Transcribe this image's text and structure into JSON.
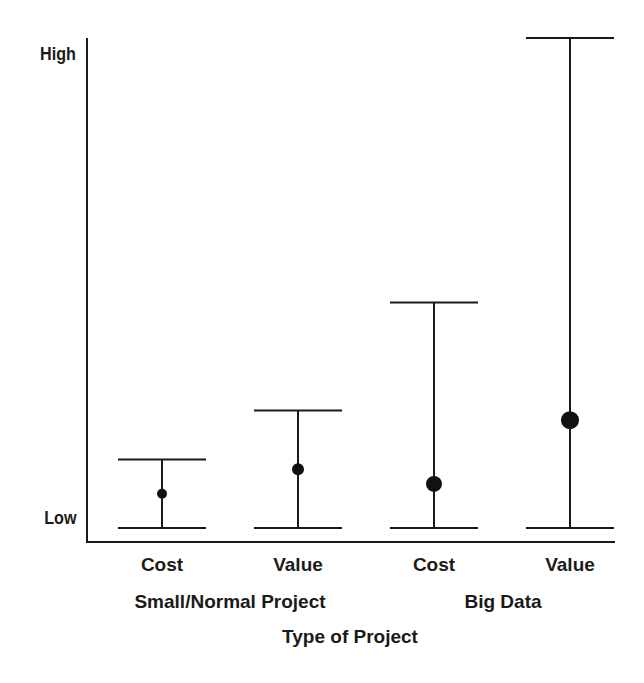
{
  "chart_data": {
    "type": "errorbar",
    "title": "",
    "xlabel": "Type of Project",
    "ylabel": "",
    "y_tick_labels": [
      "Low",
      "High"
    ],
    "ylim": [
      0,
      10
    ],
    "grid": false,
    "legend": null,
    "groups": [
      {
        "name": "Small/Normal Project",
        "categories": [
          "Cost",
          "Value"
        ]
      },
      {
        "name": "Big Data",
        "categories": [
          "Cost",
          "Value"
        ]
      }
    ],
    "categories": [
      "Cost",
      "Value",
      "Cost",
      "Value"
    ],
    "series": [
      {
        "name": "Small/Normal Project - Cost",
        "low": 0,
        "high": 1.4,
        "point": 0.7,
        "marker_size": "small"
      },
      {
        "name": "Small/Normal Project - Value",
        "low": 0,
        "high": 2.4,
        "point": 1.2,
        "marker_size": "small-medium"
      },
      {
        "name": "Big Data - Cost",
        "low": 0,
        "high": 4.6,
        "point": 0.9,
        "marker_size": "medium"
      },
      {
        "name": "Big Data - Value",
        "low": 0,
        "high": 10,
        "point": 2.2,
        "marker_size": "large"
      }
    ],
    "colors": {
      "line": "#1a1a1a",
      "marker": "#111111",
      "background": "#ffffff"
    }
  },
  "axis": {
    "y_high": "High",
    "y_low": "Low",
    "x_title": "Type of Project"
  },
  "labels": {
    "cat0": "Cost",
    "cat1": "Value",
    "cat2": "Cost",
    "cat3": "Value",
    "group0": "Small/Normal Project",
    "group1": "Big Data"
  }
}
